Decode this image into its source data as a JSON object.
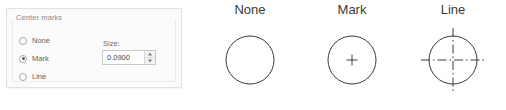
{
  "panel": {
    "group_title": "Center marks",
    "options": [
      {
        "label": "None",
        "selected": false
      },
      {
        "label": "Mark",
        "selected": true
      },
      {
        "label": "Line",
        "selected": false
      }
    ],
    "size": {
      "label": "Size:",
      "value": "0.0900"
    }
  },
  "diagrams": [
    {
      "title": "None",
      "style": "plain-circle"
    },
    {
      "title": "Mark",
      "style": "circle-with-plus"
    },
    {
      "title": "Line",
      "style": "circle-with-centerlines"
    }
  ],
  "colors": {
    "panel_background": "#fbfbfb",
    "panel_border": "#e2e2e2",
    "label_text": "#5f5f5f",
    "group_title_text": "#8b8b8b",
    "diagram_stroke": "#3a3a3a",
    "diagram_title_text": "#3a3a3a",
    "input_border": "#c9c9c9",
    "input_text": "#4a4a4a"
  }
}
